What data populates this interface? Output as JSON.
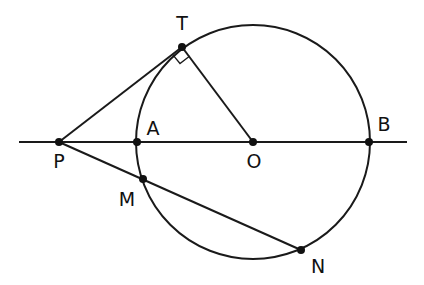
{
  "diagram": {
    "colors": {
      "stroke": "#1a1a1a",
      "background": "#ffffff"
    },
    "circle": {
      "center": "O",
      "cx": 253,
      "cy": 142,
      "r": 117
    },
    "points": {
      "T": {
        "label": "T",
        "x": 182,
        "y": 47,
        "lx": 182,
        "ly": 30
      },
      "P": {
        "label": "P",
        "x": 59,
        "y": 142,
        "lx": 59,
        "ly": 168
      },
      "A": {
        "label": "A",
        "x": 137,
        "y": 142,
        "lx": 153,
        "ly": 135
      },
      "O": {
        "label": "O",
        "x": 253,
        "y": 142,
        "lx": 254,
        "ly": 168
      },
      "B": {
        "label": "B",
        "x": 369,
        "y": 142,
        "lx": 384,
        "ly": 131
      },
      "M": {
        "label": "M",
        "x": 143,
        "y": 179,
        "lx": 127,
        "ly": 206
      },
      "N": {
        "label": "N",
        "x": 301,
        "y": 250,
        "lx": 318,
        "ly": 273
      }
    },
    "segments": [
      {
        "name": "line-PB",
        "from": [
          19,
          142
        ],
        "to": [
          407,
          142
        ]
      },
      {
        "name": "tangent-PT",
        "from": "P",
        "to": "T"
      },
      {
        "name": "radius-OT",
        "from": "O",
        "to": "T"
      },
      {
        "name": "secant-PN",
        "from": "P",
        "to": "N"
      }
    ],
    "annotations": [
      {
        "type": "right-angle",
        "at": "T",
        "between": [
          "P",
          "O"
        ]
      }
    ]
  }
}
